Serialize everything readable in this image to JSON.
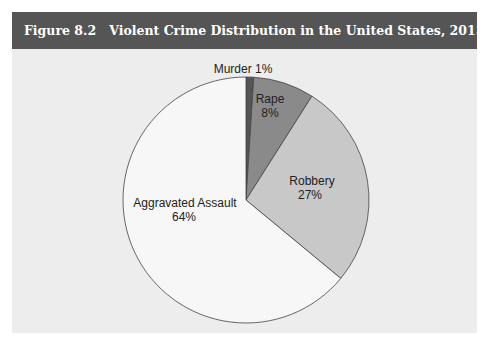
{
  "figure": {
    "number_label": "Figure 8.2",
    "title": "Violent Crime Distribution in the United States, 2015"
  },
  "chart_data": {
    "type": "pie",
    "title": "Violent Crime Distribution in the United States, 2015",
    "slices": [
      {
        "label": "Murder",
        "value": 1,
        "display": "Murder 1%",
        "color": "#555555"
      },
      {
        "label": "Rape",
        "value": 8,
        "display": "8%",
        "color": "#8a8a8a"
      },
      {
        "label": "Robbery",
        "value": 27,
        "display": "27%",
        "color": "#c8c8c8"
      },
      {
        "label": "Aggravated Assault",
        "value": 64,
        "display": "64%",
        "color": "#f7f7f7"
      }
    ],
    "categories": [
      "Murder",
      "Rape",
      "Robbery",
      "Aggravated Assault"
    ],
    "values": [
      1,
      8,
      27,
      64
    ],
    "unit": "%",
    "start_angle": "12 o'clock, clockwise"
  },
  "labels": {
    "murder": "Murder 1%",
    "rape_name": "Rape",
    "rape_pct": "8%",
    "robbery_name": "Robbery",
    "robbery_pct": "27%",
    "assault_name": "Aggravated Assault",
    "assault_pct": "64%"
  }
}
